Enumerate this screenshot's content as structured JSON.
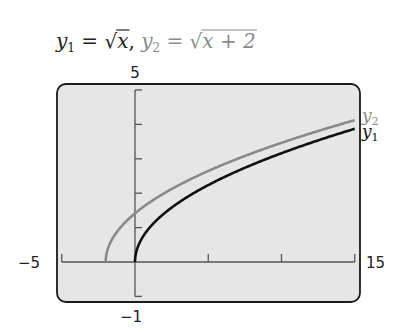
{
  "chart_data": {
    "type": "line",
    "title_parts": {
      "y1_name": "y",
      "y1_sub": "1",
      "y1_expr": "x",
      "y2_name": "y",
      "y2_sub": "2",
      "y2_expr": "x + 2"
    },
    "xlabel": "",
    "ylabel": "",
    "xlim": [
      -5,
      15
    ],
    "ylim": [
      -1,
      5
    ],
    "grid": false,
    "x_ticks": [
      -5,
      0,
      5,
      10,
      15
    ],
    "y_ticks": [
      -1,
      0,
      1,
      2,
      3,
      4,
      5
    ],
    "window_labels": {
      "xmin": "−5",
      "xmax": "15",
      "ymin": "−1",
      "ymax": "5"
    },
    "series": [
      {
        "name": "y1",
        "label": "y",
        "sub": "1",
        "formula": "sqrt(x)",
        "color": "#111111",
        "x": [
          0,
          0.25,
          1,
          2,
          4,
          6,
          9,
          12,
          15
        ],
        "values": [
          0,
          0.5,
          1,
          1.41,
          2,
          2.45,
          3,
          3.46,
          3.87
        ]
      },
      {
        "name": "y2",
        "label": "y",
        "sub": "2",
        "formula": "sqrt(x+2)",
        "color": "#8a8a8a",
        "x": [
          -2,
          -1.75,
          -1,
          0,
          2,
          4,
          7,
          10,
          15
        ],
        "values": [
          0,
          0.5,
          1,
          1.41,
          2,
          2.45,
          3,
          3.46,
          4.12
        ]
      }
    ],
    "legend_position": "right-end-of-curves"
  },
  "colors": {
    "frame_fill": "#e6e6e6",
    "frame_stroke": "#1a1a1a",
    "axis": "#555555",
    "y1": "#111111",
    "y2": "#8a8a8a"
  }
}
